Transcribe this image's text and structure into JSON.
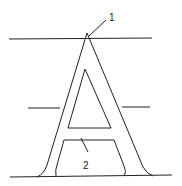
{
  "diagram": {
    "callouts": [
      {
        "id": "1",
        "label": "1",
        "target": "apex"
      },
      {
        "id": "2",
        "label": "2",
        "target": "crossbar"
      }
    ],
    "stroke_color": "#222222",
    "background": "#ffffff"
  }
}
